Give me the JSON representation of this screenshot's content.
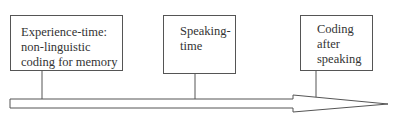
{
  "diagram": {
    "type": "timeline",
    "boxes": [
      {
        "id": "experience-time",
        "lines": [
          "Experience-time:",
          "non-linguistic",
          "coding for memory"
        ]
      },
      {
        "id": "speaking-time",
        "lines": [
          "Speaking-",
          "time"
        ]
      },
      {
        "id": "coding-after-speaking",
        "lines": [
          "Coding",
          "after",
          "speaking"
        ]
      }
    ],
    "arrow": {
      "direction": "right",
      "label": ""
    },
    "colors": {
      "stroke": "#555555",
      "text": "#333333",
      "background": "#ffffff"
    }
  }
}
